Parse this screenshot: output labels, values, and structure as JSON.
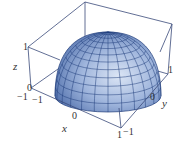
{
  "chart_data": {
    "type": "surface3d",
    "title": "",
    "surface": "upper hemisphere z = sqrt(1 - x^2 - y^2)",
    "xlabel": "x",
    "ylabel": "y",
    "zlabel": "z",
    "xlim": [
      -1,
      1
    ],
    "ylim": [
      -1,
      1
    ],
    "zlim": [
      0,
      1
    ],
    "x_ticks": [
      "-1",
      "0",
      "1"
    ],
    "y_ticks": [
      "-1",
      "0",
      "1"
    ],
    "z_ticks": [
      "0",
      "1"
    ],
    "mesh": {
      "latitude_lines": 12,
      "longitude_lines": 24
    },
    "grid": false,
    "box": true
  },
  "colors": {
    "surface_light": "#c8d6ee",
    "surface_mid": "#7f9ccc",
    "surface_dark": "#3d5ea0",
    "mesh_line": "#1f3c7a",
    "box_line": "#3a4a7a",
    "label": "#333333"
  },
  "labels": {
    "z_axis": "z",
    "x_axis": "x",
    "y_axis": "y",
    "z_tick_1": "1",
    "z_tick_0": "0",
    "x_tick_neg1": "−1",
    "x_tick_0": "0",
    "x_tick_1": "1",
    "y_tick_neg1": "−1",
    "y_tick_0": "0",
    "y_tick_1": "1"
  }
}
